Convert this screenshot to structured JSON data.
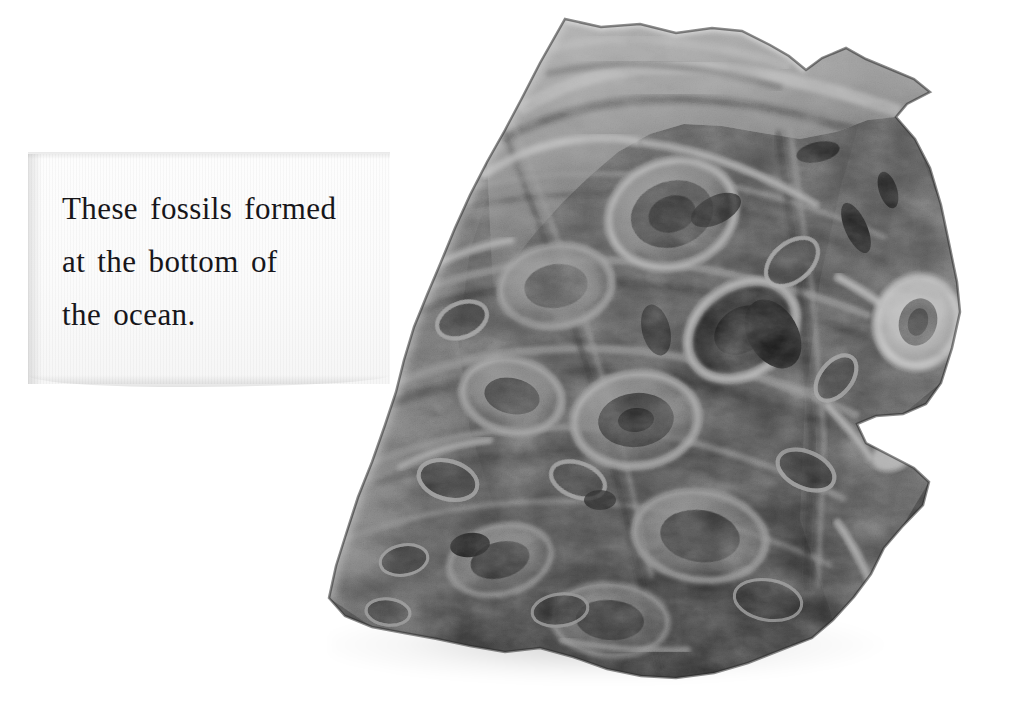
{
  "image": {
    "kind": "photograph",
    "subject": "fossil-bearing limestone specimen",
    "background_color": "#ffffff",
    "palette": {
      "background": "#ffffff",
      "card": "#fbfbfb",
      "card_shadow": "#e3e3e3",
      "text": "#17161a",
      "rock_dark": "#2b2b2b",
      "rock_mid": "#6e6e6e",
      "rock_light": "#cfcfcf",
      "rock_highlight": "#f4f4f4",
      "shadow": "#d8d8d8"
    }
  },
  "caption": {
    "lines": [
      "These fossils formed",
      "at the bottom of",
      "the ocean."
    ],
    "full_text": "These fossils formed at the bottom of the ocean."
  },
  "specimen": {
    "label": "fossil-rock-specimen",
    "description": "Large angular chunk of fossiliferous limestone with many rounded shell and coral cross-sections visible on the cut face.",
    "shadow_label": "specimen-ground-shadow"
  }
}
